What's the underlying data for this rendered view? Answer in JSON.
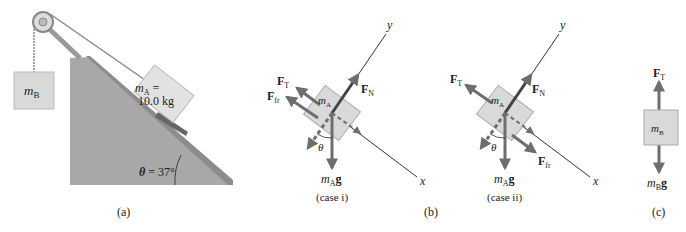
{
  "panel_a": {
    "label": "(a)",
    "block_b": {
      "m": "m",
      "sub": "B"
    },
    "block_a": {
      "m": "m",
      "sub": "A",
      "eq": " =",
      "mass": "10.0 kg"
    },
    "angle": {
      "theta": "θ",
      "value": " = 37°"
    }
  },
  "panel_b": {
    "label": "(b)",
    "case": "(case i)",
    "y_axis": "y",
    "x_axis": "x",
    "theta": "θ",
    "block": {
      "m": "m",
      "sub": "A"
    },
    "forces": {
      "tension": {
        "F": "F",
        "sub": "T"
      },
      "friction": {
        "F": "F",
        "sub": "fr"
      },
      "normal": {
        "F": "F",
        "sub": "N"
      },
      "weight": {
        "m": "m",
        "sub": "A",
        "g": "g"
      }
    }
  },
  "panel_b2": {
    "case": "(case ii)",
    "y_axis": "y",
    "x_axis": "x",
    "theta": "θ",
    "block": {
      "m": "m",
      "sub": "A"
    },
    "forces": {
      "tension": {
        "F": "F",
        "sub": "T"
      },
      "friction": {
        "F": "F",
        "sub": "fr"
      },
      "normal": {
        "F": "F",
        "sub": "N"
      },
      "weight": {
        "m": "m",
        "sub": "A",
        "g": "g"
      }
    }
  },
  "panel_c": {
    "label": "(c)",
    "block": {
      "m": "m",
      "sub": "B"
    },
    "forces": {
      "tension": {
        "F": "F",
        "sub": "T"
      },
      "weight": {
        "m": "m",
        "sub": "B",
        "g": "g"
      }
    }
  },
  "colors": {
    "incline": "#a8a8a8",
    "incline_top": "#8c8c8c",
    "block": "#d9d9d9",
    "arrow": "#6e6e6e",
    "axis": "#333333"
  }
}
